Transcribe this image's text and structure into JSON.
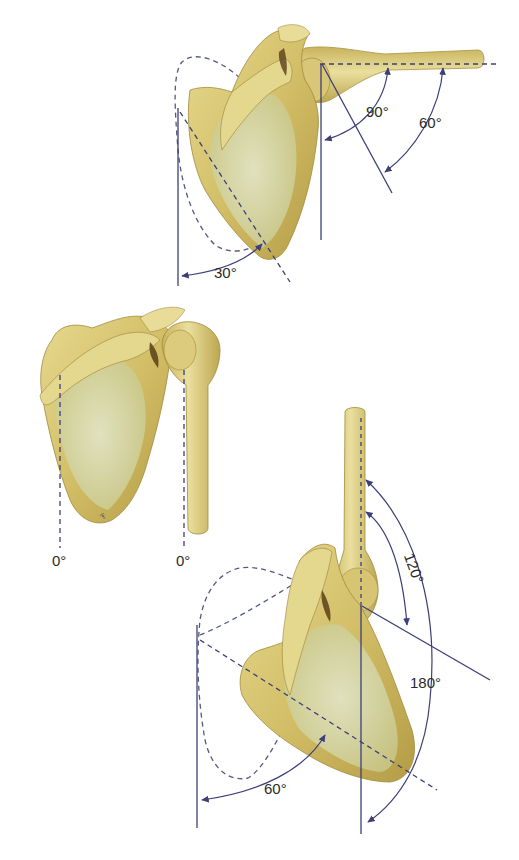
{
  "figure": {
    "colors": {
      "bone_light": "#e2d58c",
      "bone_mid": "#cdb862",
      "bone_dark": "#8f7a2c",
      "bone_shadow": "#5a3f18",
      "fossa": "#dfe4c8",
      "line": "#3c3f78",
      "background": "#ffffff"
    },
    "panels": [
      {
        "id": "rest",
        "labels": {
          "scapula_angle": "0°",
          "humerus_angle": "0°"
        }
      },
      {
        "id": "abduction-90",
        "labels": {
          "glenohumeral": "60°",
          "total": "90°",
          "scapular": "30°"
        }
      },
      {
        "id": "abduction-180",
        "labels": {
          "glenohumeral": "120°",
          "total": "180°",
          "scapular": "60°"
        }
      }
    ]
  }
}
